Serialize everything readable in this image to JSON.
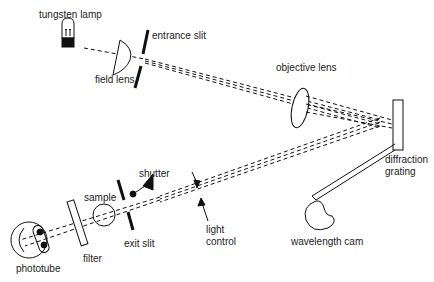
{
  "labels": {
    "tungsten_lamp": "tungsten lamp",
    "entrance_slit": "entrance slit",
    "field_lens": "field lens",
    "objective_lens": "objective lens",
    "diffraction_grating_1": "diffraction",
    "diffraction_grating_2": "grating",
    "shutter": "shutter",
    "sample": "sample",
    "exit_slit": "exit slit",
    "light_control_1": "light",
    "light_control_2": "control",
    "wavelength_cam": "wavelength cam",
    "filter": "filter",
    "phototube": "phototube"
  },
  "colors": {
    "line": "#111111",
    "background": "#ffffff"
  }
}
